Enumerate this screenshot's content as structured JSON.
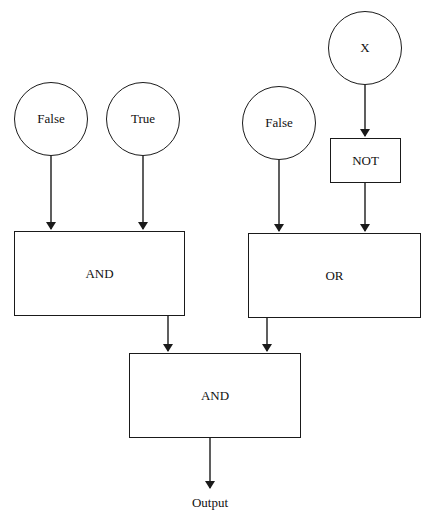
{
  "diagram": {
    "title": "",
    "type": "logic-circuit",
    "inputs": [
      {
        "id": "in1",
        "label": "False"
      },
      {
        "id": "in2",
        "label": "True"
      },
      {
        "id": "in3",
        "label": "False"
      },
      {
        "id": "in4",
        "label": "X"
      }
    ],
    "gates": [
      {
        "id": "not1",
        "label": "NOT",
        "inputs": [
          "in4"
        ]
      },
      {
        "id": "and1",
        "label": "AND",
        "inputs": [
          "in1",
          "in2"
        ]
      },
      {
        "id": "or1",
        "label": "OR",
        "inputs": [
          "in3",
          "not1"
        ]
      },
      {
        "id": "and2",
        "label": "AND",
        "inputs": [
          "and1",
          "or1"
        ]
      }
    ],
    "output": {
      "label": "Output",
      "from": "and2"
    },
    "colors": {
      "stroke": "#1a1a1a",
      "background": "#ffffff"
    }
  }
}
